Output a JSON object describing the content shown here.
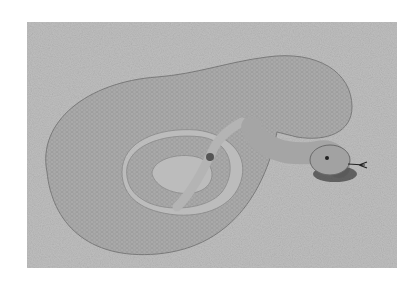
{
  "image": {
    "subject": "coiled rattlesnake on sand",
    "style": "grayscale photograph with white border",
    "colors": {
      "border": "#ffffff",
      "sand": "#bdbdbd",
      "snake_body": "#a9a9a9",
      "snake_shadow": "#3a3a3a"
    }
  }
}
